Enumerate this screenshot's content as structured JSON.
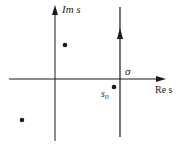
{
  "diagram": {
    "labels": {
      "imaginary_axis": "Im s",
      "real_axis": "Re s",
      "sigma": "σ",
      "s0_main": "s",
      "s0_sub": "0"
    },
    "points": [
      {
        "name": "pole-upper",
        "x": 65,
        "y": 45
      },
      {
        "name": "s0",
        "x": 114,
        "y": 87
      },
      {
        "name": "pole-lower",
        "x": 22,
        "y": 120
      }
    ],
    "colors": {
      "ink": "#1a1a1a",
      "background": "#ffffff"
    }
  }
}
